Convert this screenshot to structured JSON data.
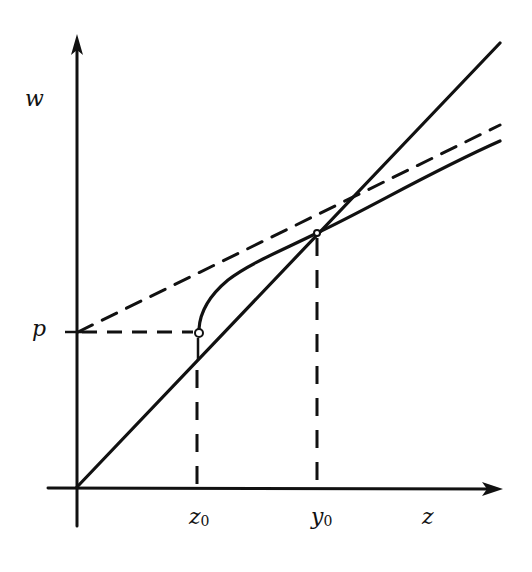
{
  "diagram": {
    "type": "function-plot",
    "stroke_color": "#111111",
    "background": "#ffffff",
    "axes": {
      "x_label": "z",
      "y_label": "w",
      "origin_px": [
        77,
        487
      ],
      "x_axis_end_px": [
        503,
        489
      ],
      "y_axis_end_px": [
        77,
        35
      ]
    },
    "labels": {
      "w": "w",
      "z": "z",
      "p": "p",
      "z0_main": "z",
      "z0_sub": "0",
      "y0_main": "y",
      "y0_sub": "0"
    },
    "lines": [
      {
        "name": "identity-line",
        "style": "solid",
        "from": [
          77,
          487
        ],
        "to": [
          500,
          43
        ]
      },
      {
        "name": "tangent-line",
        "style": "dashed",
        "from": [
          77,
          332
        ],
        "to": [
          500,
          125
        ]
      },
      {
        "name": "p-horizontal-guide",
        "style": "dashed",
        "from": [
          77,
          332
        ],
        "to": [
          195,
          332
        ]
      },
      {
        "name": "z0-vertical-guide",
        "style": "dashed",
        "from": [
          197,
          362
        ],
        "to": [
          197,
          487
        ]
      },
      {
        "name": "y0-vertical-guide",
        "style": "dashed",
        "from": [
          317,
          236
        ],
        "to": [
          317,
          487
        ]
      }
    ],
    "curve": {
      "name": "function-curve",
      "points": [
        [
          199,
          329
        ],
        [
          203,
          313
        ],
        [
          212,
          296
        ],
        [
          226,
          281
        ],
        [
          246,
          268
        ],
        [
          272,
          255
        ],
        [
          296,
          243
        ],
        [
          317,
          233
        ],
        [
          360,
          214
        ],
        [
          420,
          180
        ],
        [
          500,
          141
        ]
      ]
    },
    "markers": [
      {
        "name": "open-circle-z0",
        "at": [
          199,
          333
        ]
      },
      {
        "name": "fixed-point-y0",
        "at": [
          317,
          233
        ]
      }
    ]
  }
}
